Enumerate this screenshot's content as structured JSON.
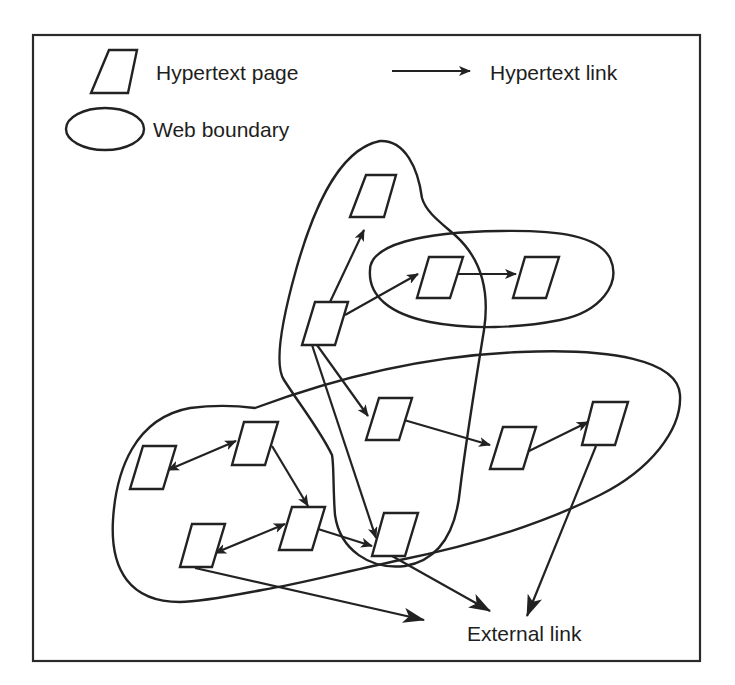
{
  "legend": {
    "page_label": "Hypertext page",
    "link_label": "Hypertext link",
    "boundary_label": "Web boundary"
  },
  "annotations": {
    "external_link": "External link"
  },
  "pages": [
    {
      "id": "p1",
      "web": "tall"
    },
    {
      "id": "p2",
      "web": "top-right"
    },
    {
      "id": "p3",
      "web": "top-right"
    },
    {
      "id": "p4",
      "web": "tall"
    },
    {
      "id": "p5",
      "web": "bottom"
    },
    {
      "id": "p6",
      "web": "bottom"
    },
    {
      "id": "p7",
      "web": "bottom"
    },
    {
      "id": "p8",
      "web": "bottom"
    },
    {
      "id": "p9",
      "web": "bottom"
    },
    {
      "id": "p10",
      "web": "bottom"
    },
    {
      "id": "p11",
      "web": "bottom"
    },
    {
      "id": "p12",
      "web": "tall"
    }
  ],
  "links": [
    {
      "from": "p4",
      "to": "p1",
      "type": "one-way"
    },
    {
      "from": "p4",
      "to": "p2",
      "type": "one-way"
    },
    {
      "from": "p2",
      "to": "p3",
      "type": "one-way"
    },
    {
      "from": "p4",
      "to": "p5",
      "type": "one-way"
    },
    {
      "from": "p4",
      "to": "p12",
      "type": "one-way"
    },
    {
      "from": "p5",
      "to": "p6",
      "type": "one-way"
    },
    {
      "from": "p6",
      "to": "p7",
      "type": "one-way"
    },
    {
      "from": "p8",
      "to": "p9",
      "type": "two-way"
    },
    {
      "from": "p9",
      "to": "p10",
      "type": "one-way"
    },
    {
      "from": "p10",
      "to": "p11",
      "type": "two-way"
    },
    {
      "from": "p10",
      "to": "p12",
      "type": "one-way"
    },
    {
      "from": "p11",
      "to": "external",
      "type": "one-way"
    },
    {
      "from": "p12",
      "to": "external",
      "type": "one-way"
    },
    {
      "from": "p7",
      "to": "external",
      "type": "one-way"
    }
  ]
}
